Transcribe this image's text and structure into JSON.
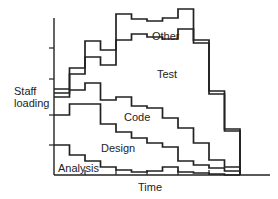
{
  "chart_data": {
    "type": "area",
    "subtype": "stacked-step",
    "title": "",
    "xlabel": "Time",
    "ylabel": "Staff loading",
    "grid": false,
    "legend": "inline labels",
    "x_intervals": 12,
    "x_ticks": 6,
    "y_ticks": 4,
    "series": [
      {
        "name": "Analysis",
        "values": [
          3.0,
          2.0,
          1.6,
          1.0,
          0.7,
          0.5,
          0.6,
          1.0,
          0.5,
          0.4,
          0.3,
          0.2
        ]
      },
      {
        "name": "Design",
        "values": [
          3.2,
          4.0,
          3.7,
          3.0,
          2.2,
          1.6,
          1.3,
          1.1,
          1.1,
          0.8,
          0.6,
          0.4
        ]
      },
      {
        "name": "Code",
        "values": [
          1.9,
          2.2,
          2.8,
          2.5,
          3.4,
          3.0,
          2.8,
          2.0,
          1.7,
          1.4,
          0.8,
          0.5
        ]
      },
      {
        "name": "Test",
        "values": [
          0.5,
          1.6,
          2.5,
          3.5,
          1.3,
          3.4,
          2.9,
          3.2,
          4.9,
          4.3,
          3.6,
          2.0
        ]
      },
      {
        "name": "Other",
        "values": [
          0.4,
          0.6,
          1.6,
          1.5,
          3.1,
          3.4,
          3.6,
          3.5,
          1.8,
          0.4,
          0.3,
          0.2
        ]
      }
    ],
    "stack_tops_px": {
      "Analysis": [
        145,
        155,
        161,
        167,
        170,
        172,
        171,
        167,
        172,
        173,
        174,
        175
      ],
      "Design": [
        115,
        104,
        104,
        124,
        132,
        138,
        143,
        147,
        161,
        165,
        168,
        171
      ],
      "Code": [
        97,
        90,
        83,
        100,
        97,
        106,
        108,
        118,
        128,
        143,
        160,
        167
      ],
      "Test": [
        93,
        74,
        57,
        65,
        40,
        34,
        37,
        39,
        29,
        43,
        94,
        131
      ],
      "Other": [
        89,
        68,
        41,
        50,
        14,
        19,
        21,
        18,
        9,
        40,
        91,
        129
      ]
    }
  },
  "labels": {
    "ylabel_line1": "Staff",
    "ylabel_line2": "loading",
    "xlabel": "Time",
    "other": "Other",
    "test": "Test",
    "code": "Code",
    "design": "Design",
    "analysis": "Analysis"
  }
}
